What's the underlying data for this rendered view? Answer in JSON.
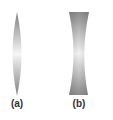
{
  "figure": {
    "lenses": [
      {
        "id": "a",
        "label": "(a)",
        "type": "convex",
        "description": "biconvex converging lens"
      },
      {
        "id": "b",
        "label": "(b)",
        "type": "concave",
        "description": "biconcave diverging lens"
      }
    ],
    "colors": {
      "lens_dark": "#8a8a8a",
      "lens_light": "#f4f4f4",
      "label": "#333333"
    }
  }
}
